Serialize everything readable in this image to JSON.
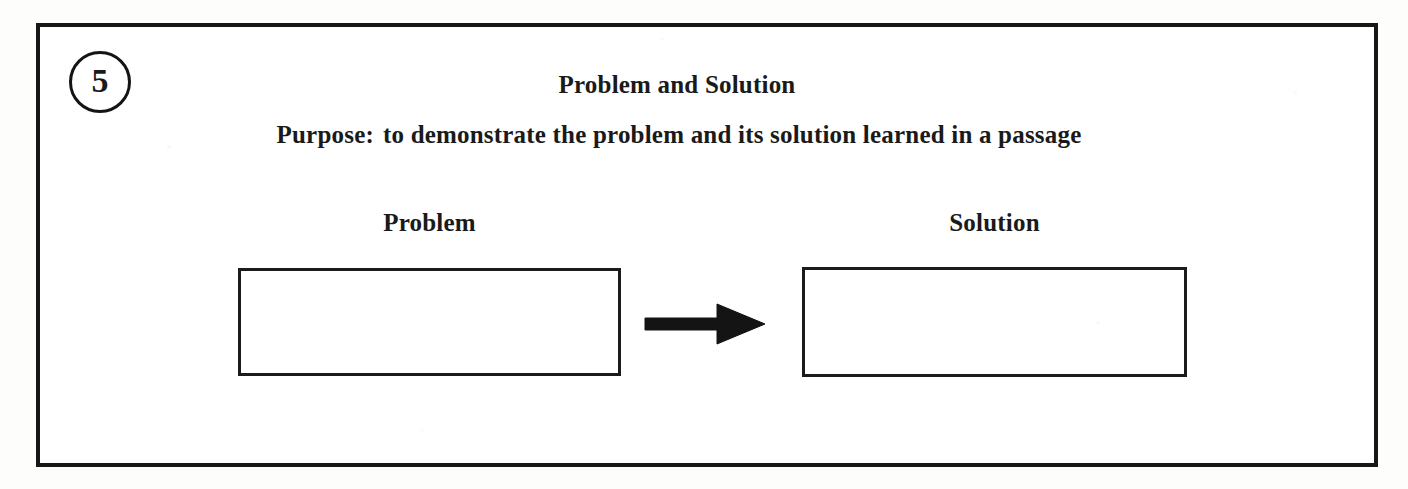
{
  "worksheet": {
    "number_badge": "5",
    "title": "Problem and Solution",
    "purpose_label": "Purpose:",
    "purpose_text": "to demonstrate the problem and its solution learned in a passage",
    "colors": {
      "ink": "#171717",
      "paper": "#ffffff",
      "page_background": "#fdfdfc"
    }
  },
  "diagram": {
    "type": "flow",
    "nodes": [
      {
        "id": "problem",
        "label": "Problem",
        "value": ""
      },
      {
        "id": "solution",
        "label": "Solution",
        "value": ""
      }
    ],
    "connector": {
      "from": "problem",
      "to": "solution",
      "icon": "right-arrow-icon"
    }
  }
}
